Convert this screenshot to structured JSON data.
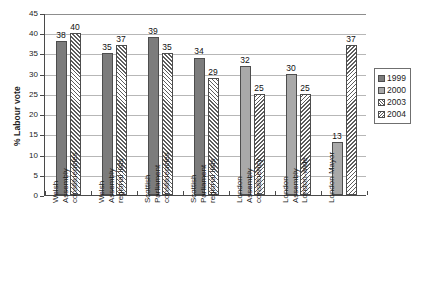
{
  "chart_data": {
    "type": "bar",
    "title": "",
    "xlabel": "",
    "ylabel": "% Labour vote",
    "ylim": [
      0,
      45
    ],
    "ytick_step": 5,
    "yticks": [
      "0",
      "5",
      "10",
      "15",
      "20",
      "25",
      "30",
      "35",
      "40",
      "45"
    ],
    "grid": true,
    "legend_position": "right",
    "categories": [
      "Welsh Assembly constituencies",
      "Welsh Assembly regional lists",
      "Scottish Parliament constituencies",
      "Scottish Parliament regional lists",
      "London Assembly constituency",
      "London Assembly London-wide",
      "London Mayor"
    ],
    "category_lines": [
      [
        "Welsh",
        "Assembly",
        "constituencies"
      ],
      [
        "Welsh",
        "Assembly",
        "regional lists"
      ],
      [
        "Scottish",
        "Parliament",
        "constituencies"
      ],
      [
        "Scottish",
        "Parliament",
        "regional lists"
      ],
      [
        "London",
        "Assembly",
        "constituency"
      ],
      [
        "London",
        "Assembly",
        "London-wide"
      ],
      [
        "London Mayor"
      ]
    ],
    "series": [
      {
        "name": "1999",
        "color": "#7c7c7c",
        "fill": "solid-dark",
        "values": [
          38,
          35,
          39,
          34,
          null,
          null,
          null
        ]
      },
      {
        "name": "2000",
        "color": "#a9a9a9",
        "fill": "solid-light",
        "values": [
          null,
          null,
          null,
          null,
          32,
          30,
          13
        ]
      },
      {
        "name": "2003",
        "color": "#ffffff",
        "fill": "hatch-forward",
        "values": [
          40,
          37,
          35,
          29,
          null,
          null,
          null
        ]
      },
      {
        "name": "2004",
        "color": "#ffffff",
        "fill": "hatch-back",
        "values": [
          null,
          null,
          null,
          null,
          25,
          25,
          37
        ]
      }
    ],
    "bars": [
      {
        "group": 0,
        "slot": 0,
        "series": "1999",
        "value": 38,
        "label": "38"
      },
      {
        "group": 0,
        "slot": 1,
        "series": "2003",
        "value": 40,
        "label": "40"
      },
      {
        "group": 1,
        "slot": 0,
        "series": "1999",
        "value": 35,
        "label": "35"
      },
      {
        "group": 1,
        "slot": 1,
        "series": "2003",
        "value": 37,
        "label": "37"
      },
      {
        "group": 2,
        "slot": 0,
        "series": "1999",
        "value": 39,
        "label": "39"
      },
      {
        "group": 2,
        "slot": 1,
        "series": "2003",
        "value": 35,
        "label": "35"
      },
      {
        "group": 3,
        "slot": 0,
        "series": "1999",
        "value": 34,
        "label": "34"
      },
      {
        "group": 3,
        "slot": 1,
        "series": "2003",
        "value": 29,
        "label": "29"
      },
      {
        "group": 4,
        "slot": 0,
        "series": "2000",
        "value": 32,
        "label": "32"
      },
      {
        "group": 4,
        "slot": 1,
        "series": "2004",
        "value": 25,
        "label": "25"
      },
      {
        "group": 5,
        "slot": 0,
        "series": "2000",
        "value": 30,
        "label": "30"
      },
      {
        "group": 5,
        "slot": 1,
        "series": "2004",
        "value": 25,
        "label": "25"
      },
      {
        "group": 6,
        "slot": 0,
        "series": "2000",
        "value": 13,
        "label": "13"
      },
      {
        "group": 6,
        "slot": 1,
        "series": "2004",
        "value": 37,
        "label": "37"
      }
    ]
  },
  "legend": {
    "items": [
      {
        "label": "1999",
        "swatch": "s1999"
      },
      {
        "label": "2000",
        "swatch": "s2000"
      },
      {
        "label": "2003",
        "swatch": "s2003"
      },
      {
        "label": "2004",
        "swatch": "s2004"
      }
    ]
  },
  "caption": {
    "text": ""
  }
}
